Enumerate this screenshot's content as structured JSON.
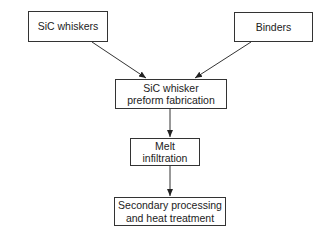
{
  "diagram": {
    "type": "flowchart",
    "nodes": [
      {
        "id": "sic_whiskers",
        "label": "SiC whiskers"
      },
      {
        "id": "binders",
        "label": "Binders"
      },
      {
        "id": "preform",
        "label_line1": "SiC whisker",
        "label_line2": "preform fabrication"
      },
      {
        "id": "melt",
        "label_line1": "Melt",
        "label_line2": "infiltration"
      },
      {
        "id": "secondary",
        "label_line1": "Secondary processing",
        "label_line2": "and heat treatment"
      }
    ],
    "edges": [
      {
        "from": "sic_whiskers",
        "to": "preform"
      },
      {
        "from": "binders",
        "to": "preform"
      },
      {
        "from": "preform",
        "to": "melt"
      },
      {
        "from": "melt",
        "to": "secondary"
      }
    ]
  }
}
